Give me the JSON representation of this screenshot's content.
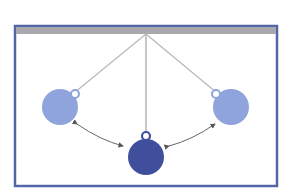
{
  "diagram": {
    "type": "pendulum-swing",
    "colors": {
      "frame": "#5566a8",
      "ceiling": "#a9a9ad",
      "string": "#b8b8bc",
      "bob_extreme": "#8fa3dc",
      "bob_center": "#3f4f9c",
      "arrow": "#555555",
      "background": "#ffffff"
    },
    "frame": {
      "x": 15,
      "y": 25,
      "width": 262,
      "height": 161
    },
    "pivot": {
      "x": 146,
      "y": 33
    },
    "bobs": [
      {
        "id": "left",
        "x": 60,
        "y": 106,
        "r": 18,
        "role": "extreme"
      },
      {
        "id": "center",
        "x": 147,
        "y": 157,
        "r": 18,
        "role": "equilibrium"
      },
      {
        "id": "right",
        "x": 231,
        "y": 106,
        "r": 18,
        "role": "extreme"
      }
    ]
  }
}
